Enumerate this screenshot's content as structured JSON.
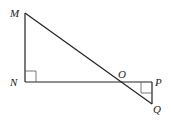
{
  "diagram": {
    "points": {
      "M": {
        "label": "M",
        "x": 25,
        "y": 13
      },
      "N": {
        "label": "N",
        "x": 25,
        "y": 82
      },
      "O": {
        "label": "O",
        "x": 122,
        "y": 82
      },
      "P": {
        "label": "P",
        "x": 152,
        "y": 82
      },
      "Q": {
        "label": "Q",
        "x": 152,
        "y": 104
      }
    },
    "right_angles": [
      "N",
      "P"
    ],
    "segments": [
      "MN",
      "NP",
      "MQ",
      "PQ"
    ],
    "line_color": "#222222"
  }
}
